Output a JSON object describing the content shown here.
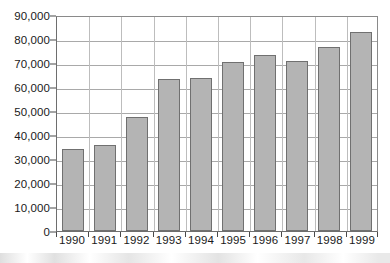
{
  "chart_data": {
    "type": "bar",
    "title": "",
    "subtitle": "",
    "xlabel": "",
    "ylabel": "",
    "categories": [
      "1990",
      "1991",
      "1992",
      "1993",
      "1994",
      "1995",
      "1996",
      "1997",
      "1998",
      "1999"
    ],
    "values": [
      34000,
      36000,
      47500,
      63200,
      63700,
      70500,
      73200,
      71000,
      76500,
      83000
    ],
    "series": [
      {
        "name": "",
        "values": [
          34000,
          36000,
          47500,
          63200,
          63700,
          70500,
          73200,
          71000,
          76500,
          83000
        ]
      }
    ],
    "ylim": [
      0,
      90000
    ],
    "y_ticks": [
      0,
      10000,
      20000,
      30000,
      40000,
      50000,
      60000,
      70000,
      80000,
      90000
    ],
    "y_tick_labels": [
      "0",
      "10,000",
      "20,000",
      "30,000",
      "40,000",
      "50,000",
      "60,000",
      "70,000",
      "80,000",
      "90,000"
    ],
    "x_tick_labels": [
      "1990",
      "1991",
      "1992",
      "1993",
      "1994",
      "1995",
      "1996",
      "1997",
      "1998",
      "1999"
    ],
    "grid": true,
    "grid_axis": "y",
    "legend": false,
    "legend_position": "none",
    "annotations": [],
    "colors": {
      "bar_fill": "#b4b4b4",
      "bar_border": "#707070",
      "gridline": "#a9a9a9",
      "axis": "#555555",
      "plot_border": "#6e6e6e",
      "text": "#1a1a1a",
      "background": "#ffffff"
    }
  }
}
